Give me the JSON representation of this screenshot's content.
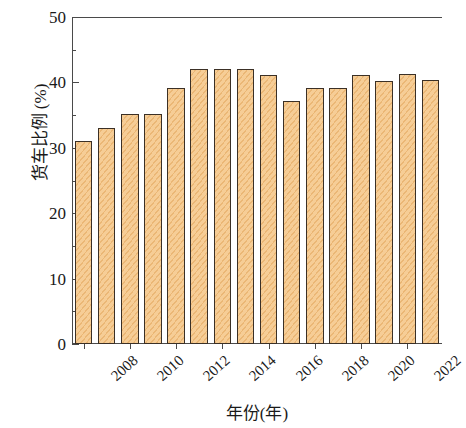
{
  "chart_data": {
    "type": "bar",
    "title": "",
    "xlabel": "年份(年)",
    "ylabel": "货车比例 (%)",
    "categories": [
      "2008",
      "2009",
      "2010",
      "2011",
      "2012",
      "2013",
      "2014",
      "2015",
      "2016",
      "2017",
      "2018",
      "2019",
      "2020",
      "2021",
      "2022",
      "2023"
    ],
    "values": [
      31.1,
      33.0,
      35.1,
      35.1,
      39.2,
      42.1,
      42.1,
      42.1,
      41.1,
      37.2,
      39.2,
      39.2,
      41.1,
      40.2,
      41.3,
      40.3
    ],
    "ylim": [
      0,
      50
    ],
    "yticks_major": [
      0,
      10,
      20,
      30,
      40,
      50
    ],
    "yticks_minor": [
      5,
      15,
      25,
      35,
      45
    ],
    "ytick_labels": [
      "0",
      "10",
      "20",
      "30",
      "40",
      "50"
    ],
    "xtick_labels": [
      "2008",
      "2010",
      "2012",
      "2014",
      "2016",
      "2018",
      "2020",
      "2022"
    ],
    "xtick_categories": [
      "2008",
      "2010",
      "2012",
      "2014",
      "2016",
      "2018",
      "2020",
      "2022"
    ],
    "grid": false,
    "legend": null,
    "bar_fill_color": "#f6cd96",
    "bar_edge_color": "#3b3026",
    "bar_hatch": "diagonal",
    "axis_color": "#4a4a4a"
  }
}
